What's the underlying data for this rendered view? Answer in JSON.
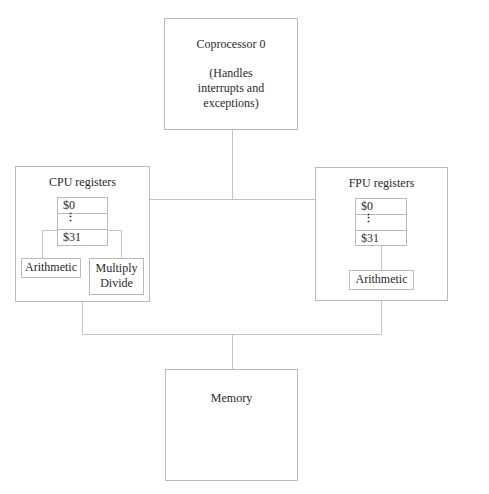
{
  "diagram": {
    "coprocessor": {
      "title": "Coprocessor 0",
      "description_lines": [
        "(Handles",
        "interrupts and",
        "exceptions)"
      ]
    },
    "cpu": {
      "title": "CPU registers",
      "registers": {
        "first": "$0",
        "ellipsis": "⋮",
        "last": "$31"
      },
      "units": {
        "arithmetic": "Arithmetic",
        "multiply_divide_lines": [
          "Multiply",
          "Divide"
        ]
      }
    },
    "fpu": {
      "title": "FPU registers",
      "registers": {
        "first": "$0",
        "ellipsis": "⋮",
        "last": "$31"
      },
      "units": {
        "arithmetic": "Arithmetic"
      }
    },
    "memory": {
      "title": "Memory"
    }
  }
}
